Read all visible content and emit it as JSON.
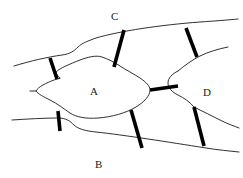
{
  "figure": {
    "type": "line-diagram",
    "width": 243,
    "height": 178,
    "background_color": "#ffffff",
    "thin_line_color": "#1a1a1a",
    "thick_line_color": "#000000",
    "thin_line_width": 0.9,
    "thick_line_width": 3.6
  },
  "labels": [
    {
      "id": "label-c",
      "text": "C",
      "x": 111,
      "y": 11
    },
    {
      "id": "label-a",
      "text": "A",
      "x": 90,
      "y": 86
    },
    {
      "id": "label-d",
      "text": "D",
      "x": 203,
      "y": 87
    },
    {
      "id": "label-b",
      "text": "B",
      "x": 95,
      "y": 159
    }
  ],
  "thin_paths": [
    {
      "id": "upper-boundary",
      "d": "M 14 66 C 30 61, 48 57, 62 55 C 70 54, 74 51, 78 47 C 82 43, 88 41, 96 38 C 120 31, 160 25, 200 22 C 215 21, 228 20, 238 19"
    },
    {
      "id": "lower-boundary",
      "d": "M 12 120 C 28 119, 44 118, 58 118 C 66 118, 70 121, 74 125 C 78 129, 86 131, 96 132 C 124 135, 168 142, 206 148 C 218 150, 230 151, 239 152"
    },
    {
      "id": "grain-a-outline",
      "d": "M 60 78 C 58 76, 56 74, 56 72 C 60 68, 70 64, 80 60 C 88 57, 96 55, 102 57 C 108 59, 114 62, 120 66 C 126 70, 134 74, 140 78 C 146 82, 150 86, 150 90 C 150 96, 144 102, 136 107 C 126 113, 112 117, 98 118 C 86 119, 76 117, 70 113 C 64 109, 58 104, 50 100 C 44 97, 38 94, 36 91 C 38 87, 46 83, 54 80 Z"
    },
    {
      "id": "grain-d-left-edge",
      "d": "M 178 71 C 172 74, 168 78, 168 83 C 168 88, 172 92, 178 95 C 184 98, 190 102, 194 107"
    },
    {
      "id": "grain-d-upper-right",
      "d": "M 178 71 C 184 66, 192 60, 200 56 C 208 52, 218 49, 228 47"
    },
    {
      "id": "grain-d-lower-right",
      "d": "M 194 107 C 202 111, 212 116, 222 121 C 228 124, 234 126, 239 128"
    },
    {
      "id": "link-a-left-stub",
      "d": "M 36 91 C 34 91, 32 91, 30 91"
    }
  ],
  "thick_paths": [
    {
      "id": "bar-left-upper",
      "d": "M 50 58 L 57 79"
    },
    {
      "id": "bar-mid-upper",
      "d": "M 114 67 L 124 30"
    },
    {
      "id": "bar-right-upper",
      "d": "M 197 57 L 186 28"
    },
    {
      "id": "bar-a-to-d",
      "d": "M 150 90 L 178 86"
    },
    {
      "id": "bar-left-lower",
      "d": "M 58 111 L 60 131"
    },
    {
      "id": "bar-mid-lower",
      "d": "M 131 110 L 142 148"
    },
    {
      "id": "bar-right-lower",
      "d": "M 194 107 L 204 146"
    }
  ]
}
